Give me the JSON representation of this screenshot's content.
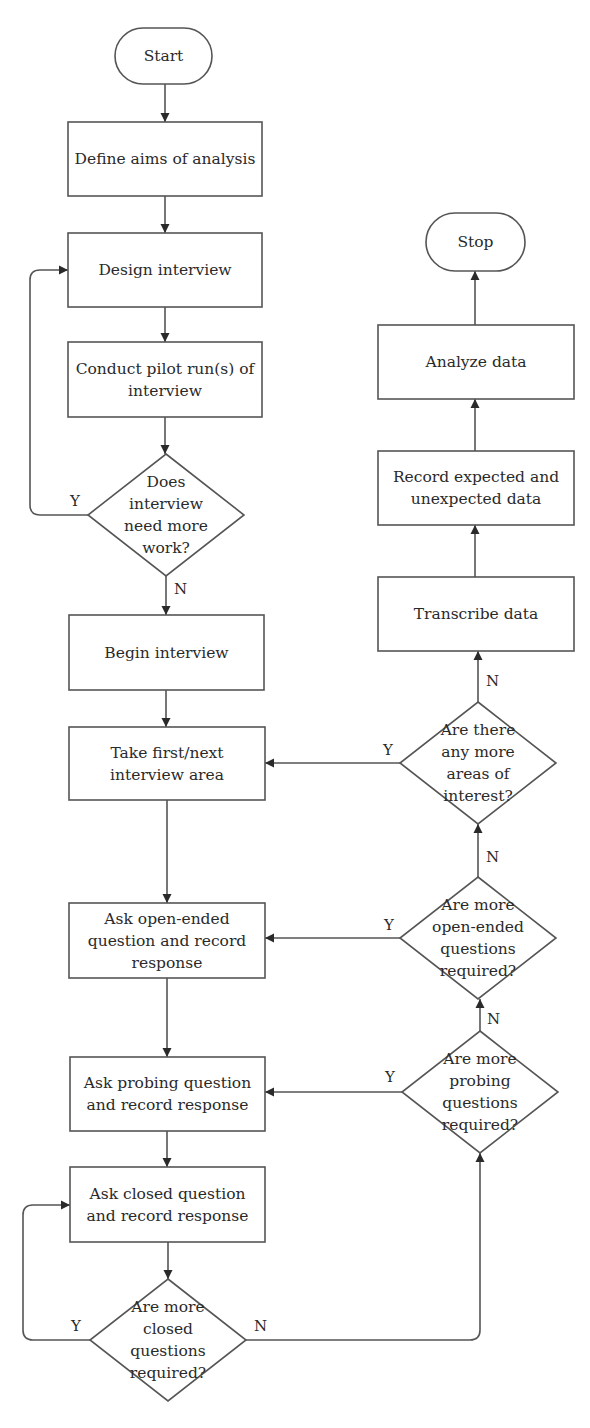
{
  "diagram": {
    "type": "flowchart",
    "colors": {
      "stroke": "#555555",
      "arrow": "#2a2a2a",
      "text": "#2a2a2a",
      "background": "#ffffff"
    },
    "nodes": [
      {
        "id": "start",
        "shape": "terminator",
        "text": "Start",
        "x": 115,
        "y": 28,
        "w": 97,
        "h": 56
      },
      {
        "id": "define",
        "shape": "process",
        "text": "Define aims of analysis",
        "x": 68,
        "y": 122,
        "w": 194,
        "h": 74
      },
      {
        "id": "design",
        "shape": "process",
        "text": "Design interview",
        "x": 68,
        "y": 233,
        "w": 194,
        "h": 74
      },
      {
        "id": "pilot",
        "shape": "process",
        "text": "Conduct pilot run(s) of interview",
        "x": 68,
        "y": 342,
        "w": 194,
        "h": 75
      },
      {
        "id": "morework",
        "shape": "decision",
        "text": "Does interview need more work?",
        "cx": 166,
        "cy": 515,
        "hw": 78,
        "hh": 61
      },
      {
        "id": "begin",
        "shape": "process",
        "text": "Begin interview",
        "x": 69,
        "y": 615,
        "w": 195,
        "h": 75
      },
      {
        "id": "take",
        "shape": "process",
        "text": "Take first/next interview area",
        "x": 69,
        "y": 727,
        "w": 196,
        "h": 73
      },
      {
        "id": "openq",
        "shape": "process",
        "text": "Ask open-ended question and record response",
        "x": 69,
        "y": 903,
        "w": 196,
        "h": 75
      },
      {
        "id": "probeq",
        "shape": "process",
        "text": "Ask probing question and record response",
        "x": 70,
        "y": 1057,
        "w": 195,
        "h": 74
      },
      {
        "id": "closedq",
        "shape": "process",
        "text": "Ask closed question and record response",
        "x": 70,
        "y": 1167,
        "w": 195,
        "h": 75
      },
      {
        "id": "moreclosed",
        "shape": "decision",
        "text": "Are more closed questions required?",
        "cx": 168,
        "cy": 1340,
        "hw": 78,
        "hh": 61
      },
      {
        "id": "moreprobe",
        "shape": "decision",
        "text": "Are more probing questions required?",
        "cx": 480,
        "cy": 1092,
        "hw": 78,
        "hh": 61
      },
      {
        "id": "moreopen",
        "shape": "decision",
        "text": "Are more open-ended questions required?",
        "cx": 478,
        "cy": 938,
        "hw": 78,
        "hh": 61
      },
      {
        "id": "moreareas",
        "shape": "decision",
        "text": "Are there any more areas of interest?",
        "cx": 478,
        "cy": 763,
        "hw": 78,
        "hh": 61
      },
      {
        "id": "transcribe",
        "shape": "process",
        "text": "Transcribe data",
        "x": 378,
        "y": 577,
        "w": 196,
        "h": 74
      },
      {
        "id": "record",
        "shape": "process",
        "text": "Record expected and unexpected data",
        "x": 378,
        "y": 451,
        "w": 196,
        "h": 74
      },
      {
        "id": "analyze",
        "shape": "process",
        "text": "Analyze data",
        "x": 378,
        "y": 325,
        "w": 196,
        "h": 74
      },
      {
        "id": "stop",
        "shape": "terminator",
        "text": "Stop",
        "x": 426,
        "y": 213,
        "w": 99,
        "h": 58
      }
    ],
    "edges": [
      {
        "from": "start",
        "to": "define",
        "label": "",
        "points": [
          [
            165,
            84
          ],
          [
            165,
            122
          ]
        ]
      },
      {
        "from": "define",
        "to": "design",
        "label": "",
        "points": [
          [
            165,
            196
          ],
          [
            165,
            233
          ]
        ]
      },
      {
        "from": "design",
        "to": "pilot",
        "label": "",
        "points": [
          [
            165,
            307
          ],
          [
            165,
            342
          ]
        ]
      },
      {
        "from": "pilot",
        "to": "morework",
        "label": "",
        "points": [
          [
            165,
            417
          ],
          [
            165,
            454
          ]
        ]
      },
      {
        "from": "morework",
        "to": "design",
        "label": "Y",
        "points": [
          [
            88,
            515
          ],
          [
            30,
            515
          ],
          [
            30,
            270
          ],
          [
            68,
            270
          ]
        ],
        "lx": 70,
        "ly": 492
      },
      {
        "from": "morework",
        "to": "begin",
        "label": "N",
        "points": [
          [
            166,
            576
          ],
          [
            166,
            615
          ]
        ],
        "lx": 174,
        "ly": 580
      },
      {
        "from": "begin",
        "to": "take",
        "label": "",
        "points": [
          [
            166,
            690
          ],
          [
            166,
            727
          ]
        ]
      },
      {
        "from": "take",
        "to": "openq",
        "label": "",
        "points": [
          [
            167,
            800
          ],
          [
            167,
            903
          ]
        ]
      },
      {
        "from": "openq",
        "to": "probeq",
        "label": "",
        "points": [
          [
            167,
            978
          ],
          [
            167,
            1057
          ]
        ]
      },
      {
        "from": "probeq",
        "to": "closedq",
        "label": "",
        "points": [
          [
            167,
            1131
          ],
          [
            167,
            1167
          ]
        ]
      },
      {
        "from": "closedq",
        "to": "moreclosed",
        "label": "",
        "points": [
          [
            168,
            1242
          ],
          [
            168,
            1279
          ]
        ]
      },
      {
        "from": "moreclosed",
        "to": "closedq",
        "label": "Y",
        "points": [
          [
            90,
            1340
          ],
          [
            23,
            1340
          ],
          [
            23,
            1205
          ],
          [
            70,
            1205
          ]
        ],
        "lx": 71,
        "ly": 1317
      },
      {
        "from": "moreclosed",
        "to": "moreprobe",
        "label": "N",
        "points": [
          [
            246,
            1340
          ],
          [
            480,
            1340
          ],
          [
            480,
            1153
          ]
        ],
        "lx": 254,
        "ly": 1317
      },
      {
        "from": "moreprobe",
        "to": "probeq",
        "label": "Y",
        "points": [
          [
            402,
            1092
          ],
          [
            265,
            1092
          ]
        ],
        "lx": 385,
        "ly": 1068
      },
      {
        "from": "moreprobe",
        "to": "moreopen",
        "label": "N",
        "points": [
          [
            480,
            1031
          ],
          [
            480,
            999
          ]
        ],
        "lx": 487,
        "ly": 1010
      },
      {
        "from": "moreopen",
        "to": "openq",
        "label": "Y",
        "points": [
          [
            400,
            938
          ],
          [
            265,
            938
          ]
        ],
        "lx": 384,
        "ly": 916
      },
      {
        "from": "moreopen",
        "to": "moreareas",
        "label": "N",
        "points": [
          [
            478,
            877
          ],
          [
            478,
            824
          ]
        ],
        "lx": 486,
        "ly": 848
      },
      {
        "from": "moreareas",
        "to": "take",
        "label": "Y",
        "points": [
          [
            400,
            763
          ],
          [
            265,
            763
          ]
        ],
        "lx": 383,
        "ly": 741
      },
      {
        "from": "moreareas",
        "to": "transcribe",
        "label": "N",
        "points": [
          [
            478,
            702
          ],
          [
            478,
            651
          ]
        ],
        "lx": 486,
        "ly": 672
      },
      {
        "from": "transcribe",
        "to": "record",
        "label": "",
        "points": [
          [
            475,
            577
          ],
          [
            475,
            525
          ]
        ]
      },
      {
        "from": "record",
        "to": "analyze",
        "label": "",
        "points": [
          [
            475,
            451
          ],
          [
            475,
            399
          ]
        ]
      },
      {
        "from": "analyze",
        "to": "stop",
        "label": "",
        "points": [
          [
            475,
            325
          ],
          [
            475,
            271
          ]
        ]
      }
    ]
  }
}
